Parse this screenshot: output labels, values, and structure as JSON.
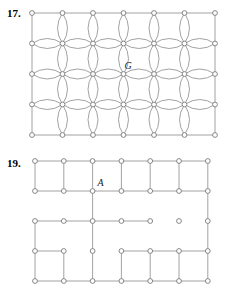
{
  "page": {
    "background": "#ffffff",
    "width": 241,
    "height": 301
  },
  "style": {
    "edge_color": "#8a8a8a",
    "node_stroke": "#7a7a7a",
    "node_fill": "#ffffff",
    "label_color": "#1a1a1a",
    "number_color": "#000000",
    "edge_width": 0.8,
    "node_radius": 2.4
  },
  "figures": [
    {
      "id": "figure-17",
      "number": "17.",
      "type": "lens-lattice-graph",
      "description": "Rectangular lattice of 7 columns by 5 rows of vertices; interior adjacent pairs joined by double arcs forming lens/petal shapes, border pairs joined by single straight segments.",
      "grid": {
        "columns": 7,
        "rows": 5,
        "x0": 32,
        "y0": 13,
        "dx": 30.5,
        "dy": 30.5
      },
      "labels": [
        {
          "text": "G",
          "col": 3,
          "row": 2,
          "dx": 1,
          "dy": -5
        }
      ]
    },
    {
      "id": "figure-19",
      "number": "19.",
      "type": "partial-grid-graph",
      "description": "Rectangular lattice of 7 columns by 5 rows of vertices with several interior edges removed.",
      "grid": {
        "columns": 7,
        "rows": 5,
        "x0": 35,
        "y0": 16,
        "dx": 28.8,
        "dy": 30.0
      },
      "horizontal_edges": [
        [
          1,
          1,
          1,
          1,
          1,
          1
        ],
        [
          1,
          1,
          1,
          1,
          1,
          1
        ],
        [
          1,
          1,
          1,
          1,
          0,
          0
        ],
        [
          1,
          0,
          0,
          1,
          1,
          1
        ],
        [
          1,
          1,
          1,
          1,
          1,
          1
        ]
      ],
      "vertical_edges": [
        [
          1,
          1,
          1,
          1,
          1,
          1,
          1
        ],
        [
          0,
          0,
          1,
          0,
          0,
          0,
          1
        ],
        [
          1,
          0,
          1,
          0,
          0,
          0,
          1
        ],
        [
          1,
          1,
          1,
          1,
          1,
          1,
          1
        ]
      ],
      "labels": [
        {
          "text": "A",
          "col": 2,
          "row": 1,
          "dx": 5,
          "dy": -5
        }
      ]
    }
  ]
}
